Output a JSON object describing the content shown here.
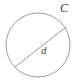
{
  "figure": {
    "background_color": "#ffffff",
    "stroke_color": "#9a9a9a",
    "label_color": "#3d3d3d",
    "width": 79,
    "height": 83,
    "shapes": {
      "circle": {
        "name": "circle-outline",
        "center_x": 38,
        "center_y": 45,
        "radius": 32
      },
      "diameter": {
        "name": "diameter-line",
        "x1": 15,
        "y1": 67,
        "x2": 66,
        "y2": 27
      }
    },
    "labels": {
      "circumference": "C",
      "diameter": "d"
    }
  }
}
